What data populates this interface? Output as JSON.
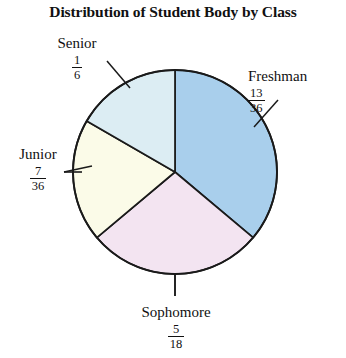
{
  "chart_data": {
    "type": "pie",
    "title": "Distribution of Student Body by Class",
    "xlabel": "",
    "ylabel": "",
    "legend_position": "none",
    "grid": false,
    "start_angle_deg": 0,
    "direction": "clockwise",
    "categories": [
      "Freshman",
      "Sophomore",
      "Junior",
      "Senior"
    ],
    "values": [
      0.3611,
      0.2778,
      0.1944,
      0.1667
    ],
    "value_labels": [
      "13/36",
      "5/18",
      "7/36",
      "1/6"
    ],
    "angles_deg": [
      130,
      100,
      70,
      60
    ],
    "slices": [
      {
        "name": "Freshman",
        "numerator": "13",
        "denominator": "36",
        "fraction": "13/36",
        "value": 0.3611,
        "angle_deg": 130,
        "start_deg": 0,
        "end_deg": 130,
        "color": "#a9cfec"
      },
      {
        "name": "Sophomore",
        "numerator": "5",
        "denominator": "18",
        "fraction": "5/18",
        "value": 0.2778,
        "angle_deg": 100,
        "start_deg": 130,
        "end_deg": 230,
        "color": "#f3e4f1"
      },
      {
        "name": "Junior",
        "numerator": "7",
        "denominator": "36",
        "fraction": "7/36",
        "value": 0.1944,
        "angle_deg": 70,
        "start_deg": 230,
        "end_deg": 300,
        "color": "#fbfbe8"
      },
      {
        "name": "Senior",
        "numerator": "1",
        "denominator": "6",
        "fraction": "1/6",
        "value": 0.1667,
        "angle_deg": 60,
        "start_deg": 300,
        "end_deg": 360,
        "color": "#dcedf3"
      }
    ]
  },
  "labels": {
    "senior": {
      "name": "Senior",
      "num": "1",
      "den": "6"
    },
    "freshman": {
      "name": "Freshman",
      "num": "13",
      "den": "36"
    },
    "junior": {
      "name": "Junior",
      "num": "7",
      "den": "36"
    },
    "sophomore": {
      "name": "Sophomore",
      "num": "5",
      "den": "18"
    }
  },
  "colors": {
    "freshman": "#a9cfec",
    "sophomore": "#f3e4f1",
    "junior": "#fbfbe8",
    "senior": "#dcedf3",
    "outline": "#1a1a1a",
    "background": "#ffffff"
  }
}
